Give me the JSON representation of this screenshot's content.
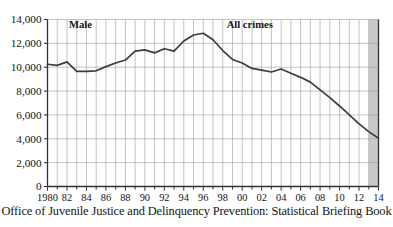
{
  "figure": {
    "caption": "Office of Juvenile Justice and Delinquency Prevention: Statistical Briefing Book",
    "name": "juvenile-arrest-rate-chart"
  },
  "chart_data": {
    "type": "line",
    "title": "",
    "subtitle": "",
    "xlabel": "",
    "ylabel": "",
    "xlim": [
      1980,
      2014
    ],
    "ylim": [
      0,
      14000
    ],
    "ytick_values": [
      0,
      2000,
      4000,
      6000,
      8000,
      10000,
      12000,
      14000
    ],
    "ytick_labels": [
      "0",
      "2,000",
      "4,000",
      "6,000",
      "8,000",
      "10,000",
      "12,000",
      "14,000"
    ],
    "xtick_values": [
      1980,
      1982,
      1984,
      1986,
      1988,
      1990,
      1992,
      1994,
      1996,
      1998,
      2000,
      2002,
      2004,
      2006,
      2008,
      2010,
      2012,
      2014
    ],
    "xtick_labels": [
      "1980",
      "82",
      "84",
      "86",
      "88",
      "90",
      "92",
      "94",
      "96",
      "98",
      "00",
      "02",
      "04",
      "06",
      "08",
      "10",
      "12",
      "14"
    ],
    "minor_xticks_every": 1,
    "grid": "both",
    "grid_color": "#9a9a9a",
    "line_color": "#3d3d3d",
    "legend": "inline-annotations",
    "annotations": [
      {
        "text": "Male",
        "x": 1982.2,
        "y": 13250,
        "bold": true
      },
      {
        "text": "All crimes",
        "x": 1998.4,
        "y": 13250,
        "bold": true
      }
    ],
    "shaded_band": {
      "x_start": 2013,
      "x_end": 2014,
      "color": "#c9c9c9"
    },
    "x": [
      1980,
      1981,
      1982,
      1983,
      1984,
      1985,
      1986,
      1987,
      1988,
      1989,
      1990,
      1991,
      1992,
      1993,
      1994,
      1995,
      1996,
      1997,
      1998,
      1999,
      2000,
      2001,
      2002,
      2003,
      2004,
      2005,
      2006,
      2007,
      2008,
      2009,
      2010,
      2011,
      2012,
      2013,
      2014
    ],
    "series": [
      {
        "name": "Male",
        "values": [
          10250,
          10150,
          10450,
          9650,
          9650,
          9700,
          10050,
          10350,
          10600,
          11350,
          11450,
          11200,
          11550,
          11350,
          12200,
          12700,
          12850,
          12300,
          11400,
          10650,
          10350,
          9900,
          9750,
          9600,
          9850,
          9500,
          9150,
          8750,
          8100,
          7450,
          6750,
          6000,
          5250,
          4600,
          4050
        ]
      }
    ]
  }
}
